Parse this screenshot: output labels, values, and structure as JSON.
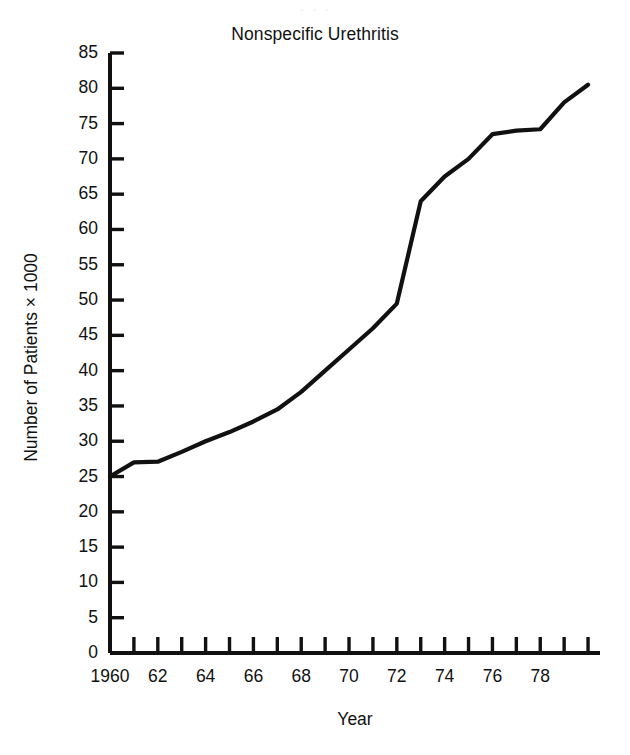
{
  "figure": {
    "scan_artifact_text": "· · ·",
    "background_color": "#ffffff",
    "line_color": "#111111",
    "text_color": "#111111"
  },
  "chart_data": {
    "type": "line",
    "title": "Nonspecific Urethritis",
    "xlabel": "Year",
    "ylabel": "Number of Patients × 1000",
    "xlim": [
      1960,
      1980.5
    ],
    "ylim": [
      0,
      85
    ],
    "grid": false,
    "legend": "none",
    "markers": "none",
    "series": [
      {
        "name": "Nonspecific Urethritis",
        "color": "#111111",
        "x": [
          1960,
          1961,
          1962,
          1963,
          1964,
          1965,
          1966,
          1967,
          1968,
          1969,
          1970,
          1971,
          1972,
          1973,
          1974,
          1975,
          1976,
          1977,
          1978,
          1979,
          1980
        ],
        "values": [
          25.0,
          27.0,
          27.1,
          28.5,
          30.0,
          31.3,
          32.8,
          34.5,
          37.0,
          40.0,
          43.0,
          46.0,
          49.5,
          64.0,
          67.5,
          70.0,
          73.5,
          74.0,
          74.2,
          78.0,
          80.5
        ]
      }
    ],
    "y_ticks": [
      0,
      5,
      10,
      15,
      20,
      25,
      30,
      35,
      40,
      45,
      50,
      55,
      60,
      65,
      70,
      75,
      80,
      85
    ],
    "y_tick_labels": [
      "0",
      "5",
      "10",
      "15",
      "20",
      "25",
      "30",
      "35",
      "40",
      "45",
      "50",
      "55",
      "60",
      "65",
      "70",
      "75",
      "80",
      "85"
    ],
    "x_ticks": [
      1960,
      1961,
      1962,
      1963,
      1964,
      1965,
      1966,
      1967,
      1968,
      1969,
      1970,
      1971,
      1972,
      1973,
      1974,
      1975,
      1976,
      1977,
      1978,
      1979,
      1980
    ],
    "x_tick_labels": [
      "1960",
      "",
      "62",
      "",
      "64",
      "",
      "66",
      "",
      "68",
      "",
      "70",
      "",
      "72",
      "",
      "74",
      "",
      "76",
      "",
      "78",
      "",
      ""
    ]
  }
}
